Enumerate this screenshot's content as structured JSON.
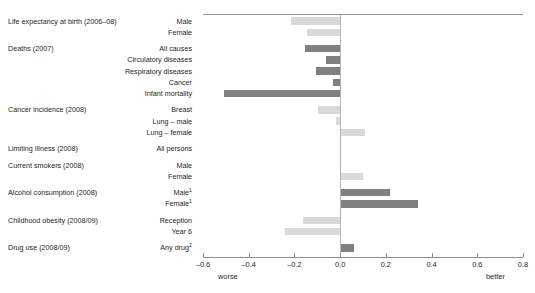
{
  "chart_data": {
    "type": "bar",
    "orientation": "horizontal",
    "title": "",
    "xlabel": "",
    "ylabel": "",
    "xlim": [
      -0.6,
      0.8
    ],
    "xticks": [
      -0.6,
      -0.4,
      -0.2,
      0.0,
      0.2,
      0.4,
      0.6,
      0.8
    ],
    "xtick_labels": [
      "–0.6",
      "–0.4",
      "–0.2",
      "0.0",
      "0.2",
      "0.4",
      "0.6",
      "0.8"
    ],
    "grid": false,
    "legend": false,
    "axis_end_left": "worse",
    "axis_end_right": "better",
    "zero_reference": 0.0,
    "colors": {
      "light": "#d9d9d9",
      "dark": "#808080",
      "axis": "#8d8d8d",
      "zero_line": "#b5b5b5",
      "text": "#231f20"
    },
    "groups": [
      {
        "label": "Life expectancy at birth (2006–08)",
        "items": [
          {
            "label": "Male",
            "value": -0.215,
            "shade": "light"
          },
          {
            "label": "Female",
            "value": -0.145,
            "shade": "light"
          }
        ]
      },
      {
        "label": "Deaths (2007)",
        "items": [
          {
            "label": "All causes",
            "value": -0.155,
            "shade": "dark"
          },
          {
            "label": "Circulatory diseases",
            "value": -0.06,
            "shade": "dark"
          },
          {
            "label": "Respiratory diseases",
            "value": -0.105,
            "shade": "dark"
          },
          {
            "label": "Cancer",
            "value": -0.03,
            "shade": "dark"
          },
          {
            "label": "Infant mortality",
            "value": -0.51,
            "shade": "dark"
          }
        ]
      },
      {
        "label": "Cancer incidence (2008)",
        "items": [
          {
            "label": "Breast",
            "value": -0.098,
            "shade": "light"
          },
          {
            "label": "Lung – male",
            "value": -0.02,
            "shade": "light"
          },
          {
            "label": "Lung – female",
            "value": 0.108,
            "shade": "light"
          }
        ]
      },
      {
        "label": "Limiting Illness (2008)",
        "items": [
          {
            "label": "All persons",
            "value": 0.0,
            "shade": "light"
          }
        ]
      },
      {
        "label": "Current smokers (2008)",
        "items": [
          {
            "label": "Male",
            "value": 0.0,
            "shade": "light"
          },
          {
            "label": "Female",
            "value": 0.1,
            "shade": "light"
          }
        ]
      },
      {
        "label": "Alcohol consumption (2008)",
        "items": [
          {
            "label": "Male",
            "footnote": "1",
            "value": 0.218,
            "shade": "dark"
          },
          {
            "label": "Female",
            "footnote": "1",
            "value": 0.34,
            "shade": "dark"
          }
        ]
      },
      {
        "label": "Childhood obesity (2008/09)",
        "items": [
          {
            "label": "Reception",
            "value": -0.163,
            "shade": "light"
          },
          {
            "label": "Year 6",
            "value": -0.242,
            "shade": "light"
          }
        ]
      },
      {
        "label": "Drug use (2008/09)",
        "items": [
          {
            "label": "Any drug",
            "footnote": "2",
            "value": 0.06,
            "shade": "dark"
          }
        ]
      }
    ]
  }
}
